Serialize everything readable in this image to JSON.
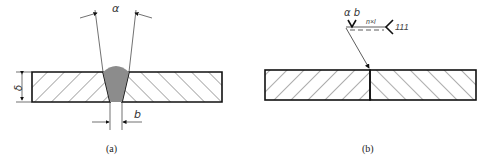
{
  "figure": {
    "panel_a": {
      "caption": "(a)",
      "labels": {
        "groove_angle": "α",
        "thickness": "δ",
        "root_gap": "b"
      },
      "weld_fill_color": "#8c8c8c"
    },
    "panel_b": {
      "caption": "(b)",
      "weld_symbol": {
        "angle_gap": "α b",
        "length_spec": "n×l",
        "process_number": "111"
      }
    },
    "colors": {
      "line": "#111111",
      "hatch": "#333333",
      "background": "#ffffff"
    }
  }
}
